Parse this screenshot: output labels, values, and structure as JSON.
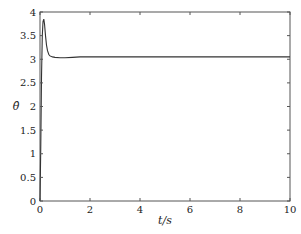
{
  "chart_data": {
    "type": "line",
    "title": "",
    "xlabel": "t/s",
    "ylabel": "θ̂",
    "xlim": [
      0,
      10
    ],
    "ylim": [
      0,
      4
    ],
    "xticks": [
      0,
      2,
      4,
      6,
      8,
      10
    ],
    "yticks": [
      0,
      0.5,
      1,
      1.5,
      2,
      2.5,
      3,
      3.5,
      4
    ],
    "ytick_labels": [
      "0",
      "0.5",
      "1",
      "1.5",
      "2",
      "2.5",
      "3",
      "3.5",
      "4"
    ],
    "xtick_labels": [
      "0",
      "2",
      "4",
      "6",
      "8",
      "10"
    ],
    "grid": false,
    "legend": null,
    "series": [
      {
        "name": "theta_hat",
        "color": "#333333",
        "x": [
          0,
          0.03,
          0.06,
          0.09,
          0.12,
          0.15,
          0.18,
          0.22,
          0.26,
          0.3,
          0.35,
          0.4,
          0.5,
          0.6,
          0.8,
          1.0,
          1.3,
          1.6,
          2.0,
          3,
          4,
          5,
          6,
          7,
          8,
          9,
          10
        ],
        "values": [
          0,
          1.2,
          2.6,
          3.5,
          3.8,
          3.85,
          3.75,
          3.5,
          3.3,
          3.18,
          3.1,
          3.07,
          3.05,
          3.04,
          3.03,
          3.03,
          3.04,
          3.05,
          3.05,
          3.05,
          3.05,
          3.05,
          3.05,
          3.05,
          3.05,
          3.05,
          3.05
        ]
      }
    ]
  },
  "axes": {
    "x_label": "t/s",
    "y_label": "θ̂"
  }
}
